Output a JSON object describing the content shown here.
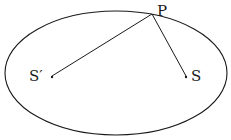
{
  "diagram": {
    "type": "ellipse-foci",
    "colors": {
      "stroke": "#1a1a1a",
      "background": "#ffffff"
    },
    "ellipse": {
      "cx": 116,
      "cy": 73,
      "rx": 111,
      "ry": 62
    },
    "points": {
      "P": {
        "label": "P",
        "x": 152,
        "y": 14
      },
      "S_prime": {
        "label": "S′",
        "x": 52,
        "y": 76
      },
      "S": {
        "label": "S",
        "x": 186,
        "y": 76
      }
    },
    "segments": [
      {
        "from": "P",
        "to": "S_prime"
      },
      {
        "from": "P",
        "to": "S"
      }
    ]
  }
}
